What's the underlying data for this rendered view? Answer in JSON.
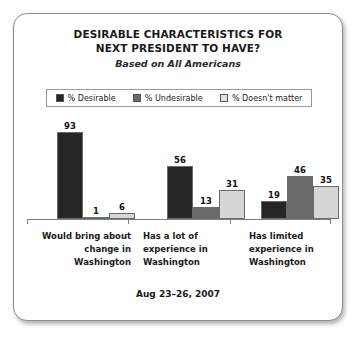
{
  "card": {
    "title_lines": [
      "DESIRABLE CHARACTERISTICS FOR",
      "NEXT PRESIDENT TO HAVE?"
    ],
    "subtitle": "Based on All Americans",
    "footer_date": "Aug 23–26, 2007"
  },
  "chart_data": {
    "type": "bar",
    "title": "DESIRABLE CHARACTERISTICS FOR NEXT PRESIDENT TO HAVE?",
    "subtitle": "Based on All Americans",
    "xlabel": "",
    "ylabel": "",
    "ylim": [
      0,
      100
    ],
    "grid": false,
    "legend_position": "top",
    "annotation": "Aug 23–26, 2007",
    "categories": [
      "Would bring about change in Washington",
      "Has a lot of experience in Washington",
      "Has limited experience in Washington"
    ],
    "category_lines": [
      [
        "Would bring about",
        "change in",
        "Washington"
      ],
      [
        "Has a lot of",
        "experience in",
        "Washington"
      ],
      [
        "Has limited",
        "experience in",
        "Washington"
      ]
    ],
    "series": [
      {
        "name": "% Desirable",
        "color": "#262626",
        "values": [
          93,
          56,
          19
        ]
      },
      {
        "name": "% Undesirable",
        "color": "#6b6b6b",
        "values": [
          1,
          13,
          46
        ]
      },
      {
        "name": "% Doesn't matter",
        "color": "#d6d6d6",
        "values": [
          6,
          31,
          35
        ]
      }
    ]
  },
  "legend": {
    "items": [
      {
        "label": "% Desirable",
        "color": "#262626"
      },
      {
        "label": "% Undesirable",
        "color": "#6b6b6b"
      },
      {
        "label": "% Doesn't matter",
        "color": "#e2e2e2"
      }
    ]
  }
}
